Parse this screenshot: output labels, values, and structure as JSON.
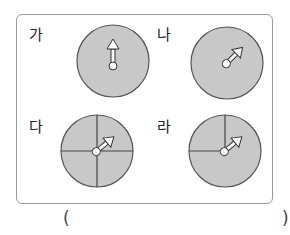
{
  "title": "",
  "panels": [
    {
      "label": "가",
      "sections": 1,
      "arrow": "up"
    },
    {
      "label": "나",
      "sections": 1,
      "arrow": "up-right"
    },
    {
      "label": "다",
      "sections": 4,
      "arrow": "up-right"
    },
    {
      "label": "라",
      "sections": 3,
      "arrow": "up-right"
    }
  ],
  "answer": {
    "open": "(",
    "close": ")",
    "value": ""
  },
  "colors": {
    "disk": "#c8c8c8",
    "outline": "#555555",
    "arrow": "#ffffff"
  }
}
